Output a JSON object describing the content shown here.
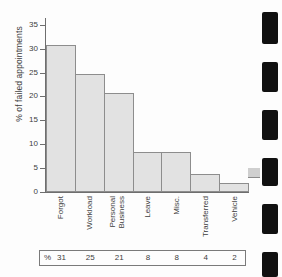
{
  "chart_data": {
    "type": "bar",
    "title": "",
    "xlabel": "",
    "ylabel": "% of failed appointments",
    "categories": [
      "Forgot",
      "Workload",
      "Personal Business",
      "Leave",
      "Misc.",
      "Transferred",
      "Vehicle"
    ],
    "values": [
      30.7,
      24.8,
      20.8,
      8.3,
      8.3,
      3.7,
      1.9
    ],
    "ylim": [
      0,
      36
    ],
    "yticks": [
      0,
      5,
      10,
      15,
      20,
      25,
      30,
      35
    ],
    "ytick_labels": [
      "0",
      "5",
      "10",
      "15",
      "20",
      "25",
      "30",
      "35"
    ],
    "grid": false,
    "legend": "none",
    "bar_fill_color": "#e2e2e2",
    "bar_edge_color": "#8d8d8d",
    "axis_color": "#6e6e6e"
  },
  "category_label_lines": [
    [
      "Forgot"
    ],
    [
      "Workload"
    ],
    [
      "Personal",
      "Business"
    ],
    [
      "Leave"
    ],
    [
      "Misc."
    ],
    [
      "Transferred"
    ],
    [
      "Vehicle"
    ]
  ],
  "data_table": {
    "row_header": "%",
    "values": [
      "31",
      "25",
      "21",
      "8",
      "8",
      "4",
      "2"
    ]
  },
  "artifacts": {
    "binding_marks_label": "binding-mark",
    "count": 6
  }
}
